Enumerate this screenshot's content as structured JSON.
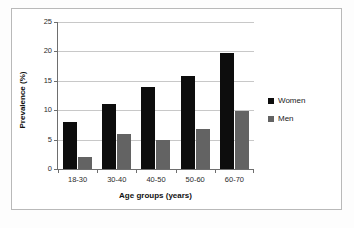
{
  "chart_data": {
    "type": "bar",
    "title": "",
    "xlabel": "Age groups (years)",
    "ylabel": "Prevalence (%)",
    "categories": [
      "18-30",
      "30-40",
      "40-50",
      "50-60",
      "60-70"
    ],
    "series": [
      {
        "name": "Women",
        "color": "#0d0d0d",
        "values": [
          8.0,
          11.0,
          14.0,
          15.8,
          19.8
        ]
      },
      {
        "name": "Men",
        "color": "#636363",
        "values": [
          2.0,
          5.9,
          4.9,
          6.8,
          9.8
        ]
      }
    ],
    "ylim": [
      0,
      25
    ],
    "ytick_labels": [
      "0",
      "5",
      "10",
      "15",
      "20",
      "25"
    ],
    "ytick_values": [
      0,
      5,
      10,
      15,
      20,
      25
    ],
    "grid": "horizontal",
    "legend_position": "right"
  },
  "legend": {
    "items": [
      {
        "label": "Women",
        "swatch": "legend-swatch-women"
      },
      {
        "label": "Men",
        "swatch": "legend-swatch-men"
      }
    ]
  },
  "axes": {
    "y_title": "Prevalence (%)",
    "x_title": "Age groups (years)"
  }
}
